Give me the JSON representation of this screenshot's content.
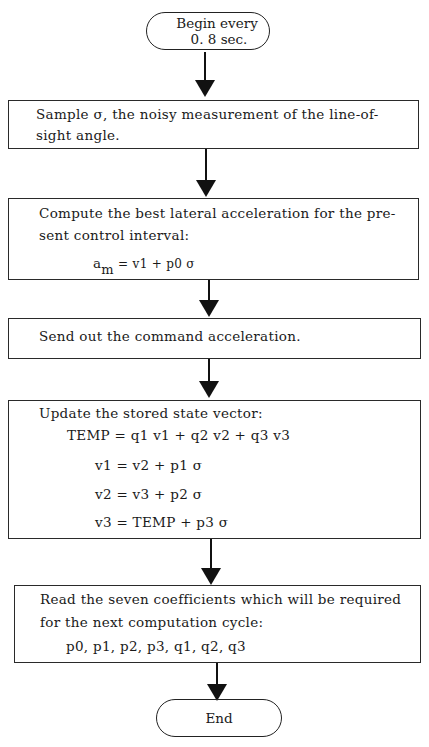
{
  "flowchart": {
    "start": {
      "line1": "Begin every",
      "line2": "0. 8 sec."
    },
    "step1": {
      "line1": "Sample σ,  the noisy measurement of the line-of-",
      "line2": "sight angle."
    },
    "step2": {
      "line1": "Compute the best lateral acceleration for the pre-",
      "line2": "sent control interval:",
      "formula_lhs": "a",
      "formula_sub": "m",
      "formula_rhs": " = v1 + p0 σ"
    },
    "step3": {
      "line1": "Send out the command acceleration."
    },
    "step4": {
      "line1": "Update the stored state vector:",
      "eq1": "TEMP = q1  v1 + q2  v2 + q3  v3",
      "eq2": "v1 = v2 + p1  σ",
      "eq3": "v2 = v3 + p2  σ",
      "eq4": "v3 = TEMP + p3  σ"
    },
    "step5": {
      "line1": "Read the seven coefficients which will be required",
      "line2": "for the next computation cycle:",
      "line3": "p0,  p1,  p2,  p3,  q1,  q2,  q3"
    },
    "end": {
      "label": "End"
    }
  }
}
